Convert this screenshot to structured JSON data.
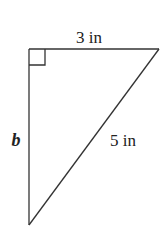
{
  "figure": {
    "type": "right-triangle",
    "stroke_color": "#333333",
    "text_color": "#222222",
    "vertices": {
      "right_angle": [
        29,
        49
      ],
      "top_right": [
        159,
        49
      ],
      "bottom": [
        29,
        225
      ]
    },
    "labels": {
      "top_side": "3 in",
      "left_side": "b",
      "hypotenuse": "5 in"
    },
    "right_angle_marker": true
  }
}
